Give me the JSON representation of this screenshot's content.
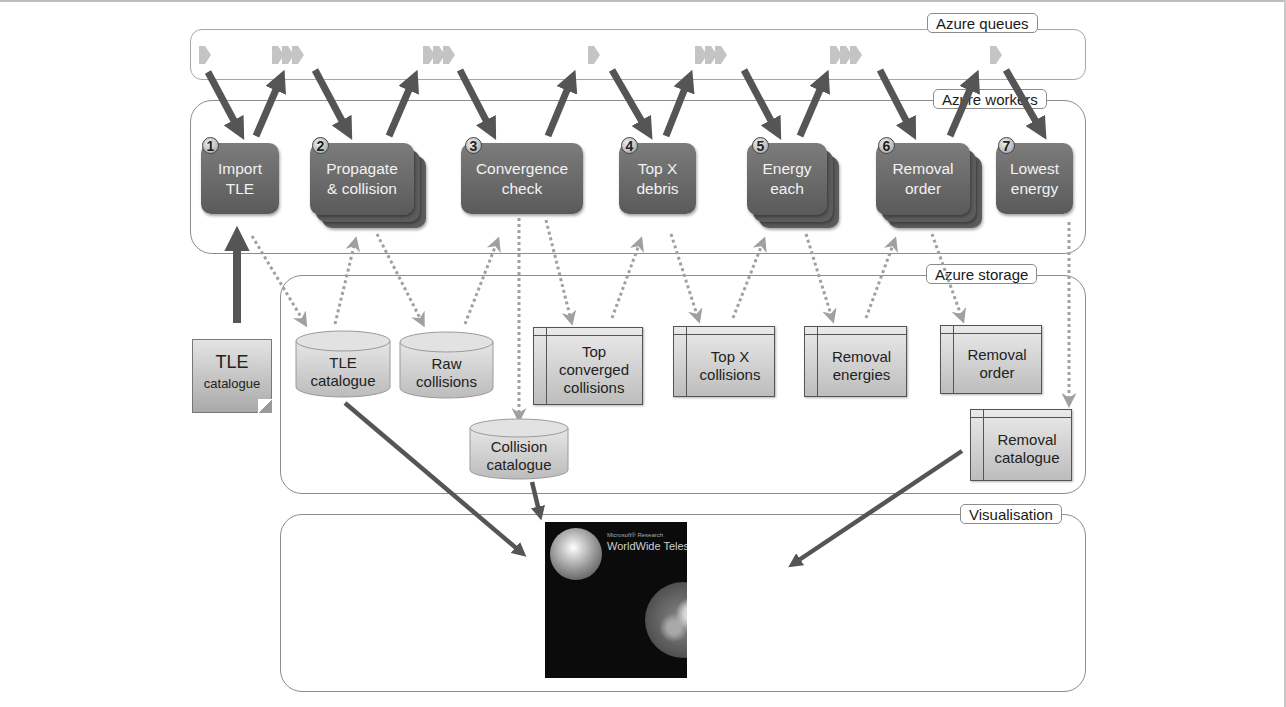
{
  "regions": {
    "queues": {
      "label": "Azure queues"
    },
    "workers": {
      "label": "Azure workers"
    },
    "storage": {
      "label": "Azure storage"
    },
    "visualisation": {
      "label": "Visualisation"
    }
  },
  "workers": [
    {
      "number": "1",
      "line1": "Import",
      "line2": "TLE",
      "stacked": false
    },
    {
      "number": "2",
      "line1": "Propagate",
      "line2": "& collision",
      "stacked": true
    },
    {
      "number": "3",
      "line1": "Convergence",
      "line2": "check",
      "stacked": false
    },
    {
      "number": "4",
      "line1": "Top X",
      "line2": "debris",
      "stacked": false
    },
    {
      "number": "5",
      "line1": "Energy",
      "line2": "each",
      "stacked": true
    },
    {
      "number": "6",
      "line1": "Removal",
      "line2": "order",
      "stacked": true
    },
    {
      "number": "7",
      "line1": "Lowest",
      "line2": "energy",
      "stacked": false
    }
  ],
  "input_document": {
    "title": "TLE",
    "subtitle": "catalogue"
  },
  "storage": {
    "blobs": [
      {
        "line1": "TLE",
        "line2": "catalogue"
      },
      {
        "line1": "Raw",
        "line2": "collisions"
      },
      {
        "line1": "Collision",
        "line2": "catalogue"
      }
    ],
    "tables": [
      {
        "line1": "Top",
        "line2": "converged",
        "line3": "collisions"
      },
      {
        "line1": "Top X",
        "line2": "collisions"
      },
      {
        "line1": "Removal",
        "line2": "energies"
      },
      {
        "line1": "Removal",
        "line2": "order"
      },
      {
        "line1": "Removal",
        "line2": "catalogue"
      }
    ]
  },
  "visualisation": {
    "brand": "Microsoft® Research",
    "title": "WorldWide Telescope"
  },
  "colors": {
    "worker_fill": "#6b6b6b",
    "arrow_solid": "#555555",
    "arrow_dotted": "#a0a0a0",
    "queue_icon": "#c4c4c4",
    "storage_fill": "#d0d0d0"
  }
}
